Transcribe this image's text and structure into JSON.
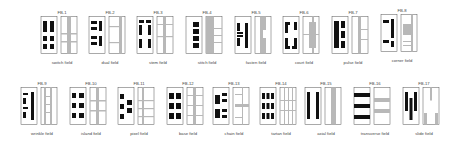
{
  "figure": {
    "rows": [
      {
        "panels": [
          {
            "code": "FB-1",
            "caption": "switch field",
            "x": 40,
            "y": 10
          },
          {
            "code": "FB-2",
            "caption": "dual field",
            "x": 88,
            "y": 10
          },
          {
            "code": "FB-3",
            "caption": "stem field",
            "x": 136,
            "y": 10
          },
          {
            "code": "FB-4",
            "caption": "stitch field",
            "x": 185,
            "y": 10
          },
          {
            "code": "FB-5",
            "caption": "fasten field",
            "x": 234,
            "y": 10
          },
          {
            "code": "FB-6",
            "caption": "court field",
            "x": 282,
            "y": 10
          },
          {
            "code": "FB-7",
            "caption": "pulse field",
            "x": 331,
            "y": 10
          },
          {
            "code": "FB-8",
            "caption": "corner field",
            "x": 380,
            "y": 8
          }
        ]
      },
      {
        "panels": [
          {
            "code": "FB-9",
            "caption": "wrinkle field",
            "x": 20,
            "y": 81
          },
          {
            "code": "FB-10",
            "caption": "island field",
            "x": 69,
            "y": 81
          },
          {
            "code": "FB-11",
            "caption": "pixel field",
            "x": 117,
            "y": 81
          },
          {
            "code": "FB-12",
            "caption": "base field",
            "x": 166,
            "y": 81
          },
          {
            "code": "FB-13",
            "caption": "chain field",
            "x": 212,
            "y": 81
          },
          {
            "code": "FB-14",
            "caption": "tartan field",
            "x": 259,
            "y": 81
          },
          {
            "code": "FB-15",
            "caption": "axial field",
            "x": 304,
            "y": 81
          },
          {
            "code": "FB-16",
            "caption": "transverse field",
            "x": 353,
            "y": 81
          },
          {
            "code": "FB-17",
            "caption": "slide field",
            "x": 402,
            "y": 81
          }
        ]
      }
    ],
    "colors": {
      "solid": "#111111",
      "field": "#b8b8b8",
      "frame": "#555555"
    }
  }
}
